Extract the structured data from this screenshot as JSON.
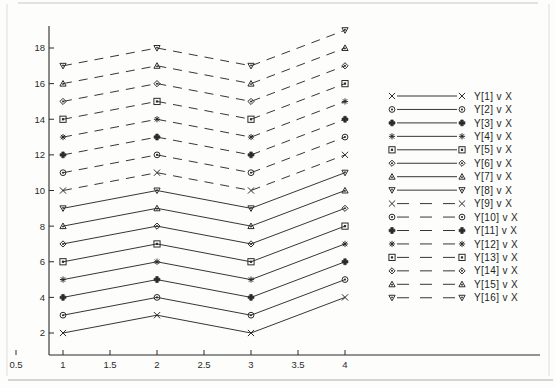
{
  "figure": {
    "background_color": "#fdfdfc",
    "ink_color": "#2b2b2b",
    "scan_artifact": true
  },
  "chart_data": {
    "type": "line",
    "title": "",
    "subtitle": "",
    "xlabel": "",
    "ylabel": "",
    "x": [
      1,
      2,
      3,
      4
    ],
    "xlim": [
      0.5,
      4.35
    ],
    "ylim": [
      1.0,
      19.8
    ],
    "xticks": [
      0.5,
      1,
      1.5,
      2,
      2.5,
      3,
      3.5,
      4
    ],
    "xticklabels": [
      "0.5",
      "1",
      "1.5",
      "2",
      "2.5",
      "3",
      "3.5",
      "4"
    ],
    "yticks": [
      2,
      4,
      6,
      8,
      10,
      12,
      14,
      16,
      18
    ],
    "yticklabels": [
      "2",
      "4",
      "6",
      "8",
      "10",
      "12",
      "14",
      "16",
      "18"
    ],
    "grid": false,
    "legend_position": "right",
    "series": [
      {
        "name": "Y[1]  v X",
        "legend_label": "Y[1]  v X",
        "marker": "cross",
        "linestyle": "solid",
        "values": [
          2,
          3,
          2,
          4
        ]
      },
      {
        "name": "Y[2]  v X",
        "legend_label": "Y[2]  v X",
        "marker": "circle-dot",
        "linestyle": "solid",
        "values": [
          3,
          4,
          3,
          5
        ]
      },
      {
        "name": "Y[3]  v X",
        "legend_label": "Y[3]  v X",
        "marker": "filled-plus",
        "linestyle": "solid",
        "values": [
          4,
          5,
          4,
          6
        ]
      },
      {
        "name": "Y[4]  v X",
        "legend_label": "Y[4]  v X",
        "marker": "asterisk",
        "linestyle": "solid",
        "values": [
          5,
          6,
          5,
          7
        ]
      },
      {
        "name": "Y[5]  v X",
        "legend_label": "Y[5]  v X",
        "marker": "square",
        "linestyle": "solid",
        "values": [
          6,
          7,
          6,
          8
        ]
      },
      {
        "name": "Y[6]  v X",
        "legend_label": "Y[6]  v X",
        "marker": "diamond",
        "linestyle": "solid",
        "values": [
          7,
          8,
          7,
          9
        ]
      },
      {
        "name": "Y[7]  v X",
        "legend_label": "Y[7]  v X",
        "marker": "triangle-up",
        "linestyle": "solid",
        "values": [
          8,
          9,
          8,
          10
        ]
      },
      {
        "name": "Y[8]  v X",
        "legend_label": "Y[8]  v X",
        "marker": "triangle-down",
        "linestyle": "solid",
        "values": [
          9,
          10,
          9,
          11
        ]
      },
      {
        "name": "Y[9]  v X",
        "legend_label": "Y[9]  v X",
        "marker": "cross",
        "linestyle": "dashed",
        "values": [
          10,
          11,
          10,
          12
        ]
      },
      {
        "name": "Y[10] v X",
        "legend_label": "Y[10] v X",
        "marker": "circle-dot",
        "linestyle": "dashed",
        "values": [
          11,
          12,
          11,
          13
        ]
      },
      {
        "name": "Y[11] v X",
        "legend_label": "Y[11] v X",
        "marker": "filled-plus",
        "linestyle": "dashed",
        "values": [
          12,
          13,
          12,
          14
        ]
      },
      {
        "name": "Y[12] v X",
        "legend_label": "Y[12] v X",
        "marker": "asterisk",
        "linestyle": "dashed",
        "values": [
          13,
          14,
          13,
          15
        ]
      },
      {
        "name": "Y[13] v X",
        "legend_label": "Y[13] v X",
        "marker": "square",
        "linestyle": "dashed",
        "values": [
          14,
          15,
          14,
          16
        ]
      },
      {
        "name": "Y[14] v X",
        "legend_label": "Y[14] v X",
        "marker": "diamond",
        "linestyle": "dashed",
        "values": [
          15,
          16,
          15,
          17
        ]
      },
      {
        "name": "Y[15] v X",
        "legend_label": "Y[15] v X",
        "marker": "triangle-up",
        "linestyle": "dashed",
        "values": [
          16,
          17,
          16,
          18
        ]
      },
      {
        "name": "Y[16] v X",
        "legend_label": "Y[16] v X",
        "marker": "triangle-down",
        "linestyle": "dashed",
        "values": [
          17,
          18,
          17,
          19
        ]
      }
    ]
  }
}
